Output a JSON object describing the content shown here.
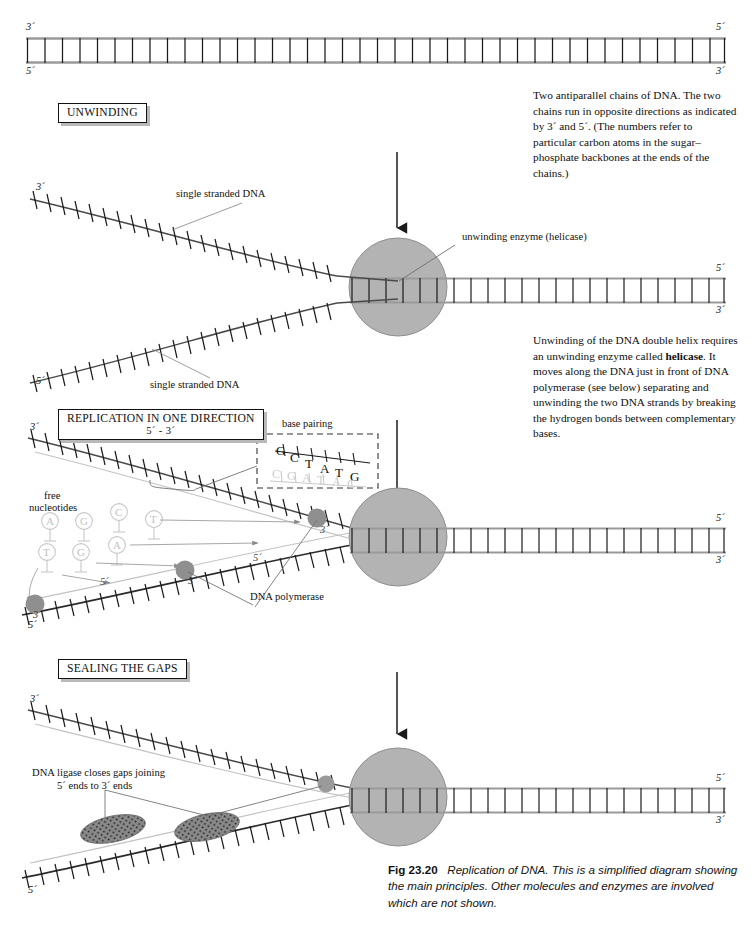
{
  "figure": {
    "number": "Fig 23.20",
    "title": "Replication of DNA.",
    "caption_rest": "This is a simplified diagram showing the main principles. Other molecules and enzymes are involved which are not shown."
  },
  "stages": [
    {
      "id": "unwinding",
      "label": "UNWINDING",
      "sublabel": ""
    },
    {
      "id": "replication",
      "label": "REPLICATION IN ONE DIRECTION",
      "sublabel": "5´ - 3´"
    },
    {
      "id": "sealing",
      "label": "SEALING THE GAPS",
      "sublabel": ""
    }
  ],
  "side_notes": [
    {
      "id": "antiparallel-note",
      "text": "Two antiparallel chains of DNA. The two chains run in opposite directions as indicated by 3´ and 5´. (The numbers refer to particular carbon atoms in the sugar–phosphate backbones at the ends of the chains.)"
    },
    {
      "id": "helicase-note",
      "lead": "Unwinding of the DNA double helix requires an unwinding enzyme called ",
      "bold": "helicase",
      "tail": ". It moves along the DNA just in front of DNA polymerase (see below) separating and unwinding the two DNA strands by breaking the hydrogen bonds between complementary bases."
    }
  ],
  "labels": {
    "single_stranded_top": "single stranded DNA",
    "single_stranded_bottom": "single stranded DNA",
    "helicase": "unwinding enzyme (helicase)",
    "base_pairing": "base pairing",
    "free_nucleotides_line1": "free",
    "free_nucleotides_line2": "nucleotides",
    "dna_polymerase": "DNA polymerase",
    "ligase_line1": "DNA ligase closes gaps joining",
    "ligase_line2": "5´ ends to 3´ ends"
  },
  "prime_marks": {
    "panel1": {
      "left_top": "3´",
      "left_bottom": "5´",
      "right_top": "5´",
      "right_bottom": "3´"
    },
    "panel2": {
      "left_top": "3´",
      "left_bottom": "5´",
      "right_top": "5´",
      "right_bottom": "3´"
    },
    "panel3": {
      "left_top": "3´",
      "left_bottom": "5´",
      "right_top": "5´",
      "right_bottom": "3´",
      "inner_a": "5´",
      "inner_b": "3´",
      "inner_c": "5´",
      "inner_d": "3´",
      "inner_e": "3´"
    },
    "panel4": {
      "left_top": "3´",
      "left_bottom": "5´",
      "right_top": "5´",
      "right_bottom": "3´"
    }
  },
  "base_pairing_box": {
    "top_strand": [
      "G",
      "C",
      "T",
      "A",
      "T",
      "G"
    ],
    "bottom_strand": [
      "C",
      "G",
      "A",
      "T",
      "A",
      "C"
    ]
  },
  "free_nucleotides": [
    {
      "base": "A",
      "x": 50,
      "y": 521
    },
    {
      "base": "G",
      "x": 84,
      "y": 521
    },
    {
      "base": "C",
      "x": 119,
      "y": 512
    },
    {
      "base": "T",
      "x": 154,
      "y": 519
    },
    {
      "base": "T",
      "x": 47,
      "y": 552
    },
    {
      "base": "G",
      "x": 81,
      "y": 552
    },
    {
      "base": "A",
      "x": 117,
      "y": 545
    }
  ],
  "colors": {
    "enzyme_fill": "#b3b3b3",
    "enzyme_stroke": "#8c8c8c",
    "polymerase_fill": "#8f8f8f",
    "ligase_fill": "#808080",
    "backbone": "#9a9a9a",
    "rung": "#1a1a1a",
    "leader": "#6e6e6e",
    "ink": "#111111"
  }
}
